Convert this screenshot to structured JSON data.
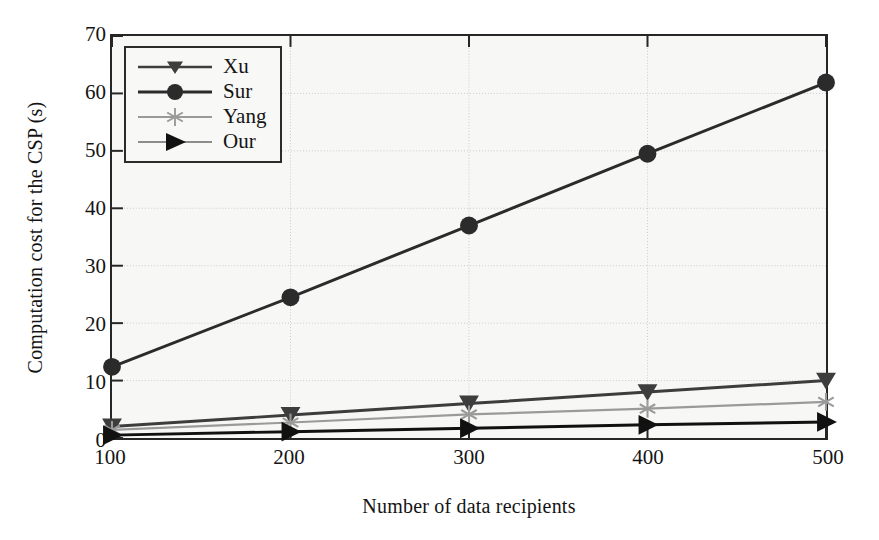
{
  "chart_data": {
    "type": "line",
    "title": "",
    "xlabel": "Number of data recipients",
    "ylabel": "Computation cost for the CSP (s)",
    "x": [
      100,
      200,
      300,
      400,
      500
    ],
    "xticklabels": [
      "100",
      "200",
      "300",
      "400",
      "500"
    ],
    "yticklabels": [
      "0",
      "10",
      "20",
      "30",
      "40",
      "50",
      "60",
      "70"
    ],
    "xlim": [
      100,
      500
    ],
    "ylim": [
      0,
      70
    ],
    "ytick_step": 10,
    "xtick_step": 100,
    "grid": true,
    "legend_position": "upper left",
    "series": [
      {
        "name": "Xu",
        "marker": "triangle-down-icon",
        "color": "#3d3d3d",
        "values": [
          2.0,
          4.0,
          6.0,
          8.0,
          10.0
        ]
      },
      {
        "name": "Sur",
        "marker": "circle-icon",
        "color": "#2b2b2b",
        "values": [
          12.4,
          24.5,
          37.0,
          49.5,
          61.9
        ]
      },
      {
        "name": "Yang",
        "marker": "asterisk-icon",
        "color": "#9a9a9a",
        "values": [
          1.4,
          2.7,
          4.1,
          5.1,
          6.3
        ]
      },
      {
        "name": "Our",
        "marker": "triangle-right-icon",
        "color": "#111111",
        "values": [
          0.5,
          1.1,
          1.7,
          2.3,
          2.8
        ]
      }
    ]
  },
  "legend": {
    "items": [
      {
        "label": "Xu"
      },
      {
        "label": "Sur"
      },
      {
        "label": "Yang"
      },
      {
        "label": "Our"
      }
    ]
  },
  "axes": {
    "ylabel": "Computation cost for the CSP (s)",
    "xlabel": "Number of data recipients",
    "yticks": [
      "70",
      "60",
      "50",
      "40",
      "30",
      "20",
      "10",
      "0"
    ],
    "xticks": [
      "100",
      "200",
      "300",
      "400",
      "500"
    ]
  }
}
